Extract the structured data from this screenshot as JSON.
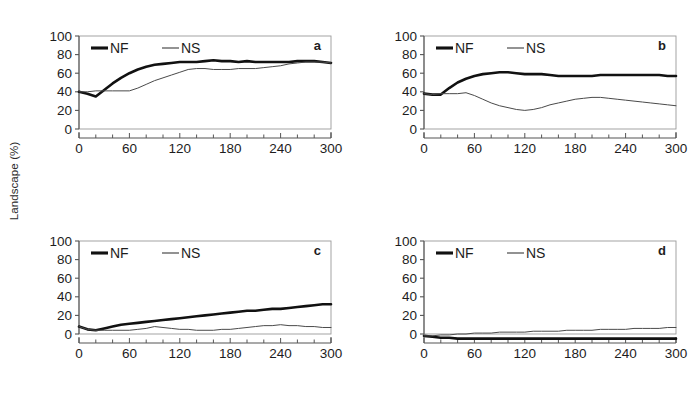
{
  "figure": {
    "ylabel": "Landscape (%)",
    "series_colors": {
      "NF": "#111111",
      "NS": "#4a4a4a"
    },
    "axis_color": "#555555"
  },
  "chart_data": [
    {
      "type": "line",
      "panel": "a",
      "title": "",
      "xlabel": "",
      "ylabel": "Landscape (%)",
      "xlim": [
        0,
        300
      ],
      "ylim": [
        0,
        100
      ],
      "xticks": [
        0,
        60,
        120,
        180,
        240,
        300
      ],
      "xtick_labels": [
        "0",
        "60",
        "120",
        "180",
        "240",
        "300"
      ],
      "yticks": [
        0,
        20,
        40,
        60,
        80,
        100
      ],
      "ytick_labels": [
        "0",
        "20",
        "40",
        "60",
        "80",
        "100"
      ],
      "minor_xtick_step": 20,
      "grid": false,
      "legend": [
        "NF",
        "NS"
      ],
      "legend_position": "top-left",
      "x": [
        0,
        10,
        20,
        30,
        40,
        50,
        60,
        70,
        80,
        90,
        100,
        110,
        120,
        130,
        140,
        150,
        160,
        170,
        180,
        190,
        200,
        210,
        220,
        230,
        240,
        250,
        260,
        270,
        280,
        290,
        300
      ],
      "series": [
        {
          "name": "NF",
          "values": [
            40,
            38,
            35,
            42,
            49,
            55,
            60,
            64,
            67,
            69,
            70,
            71,
            72,
            72,
            72,
            73,
            74,
            73,
            73,
            72,
            73,
            72,
            72,
            72,
            72,
            72,
            73,
            73,
            73,
            72,
            71
          ]
        },
        {
          "name": "NS",
          "values": [
            40,
            40,
            41,
            41,
            41,
            41,
            41,
            44,
            48,
            52,
            55,
            58,
            61,
            64,
            65,
            65,
            64,
            64,
            64,
            65,
            65,
            65,
            66,
            67,
            68,
            70,
            71,
            72,
            72,
            72,
            71
          ]
        }
      ]
    },
    {
      "type": "line",
      "panel": "b",
      "title": "",
      "xlabel": "",
      "ylabel": "Landscape (%)",
      "xlim": [
        0,
        300
      ],
      "ylim": [
        0,
        100
      ],
      "xticks": [
        0,
        60,
        120,
        180,
        240,
        300
      ],
      "xtick_labels": [
        "0",
        "60",
        "120",
        "180",
        "240",
        "300"
      ],
      "yticks": [
        0,
        20,
        40,
        60,
        80,
        100
      ],
      "ytick_labels": [
        "0",
        "20",
        "40",
        "60",
        "80",
        "100"
      ],
      "minor_xtick_step": 20,
      "grid": false,
      "legend": [
        "NF",
        "NS"
      ],
      "legend_position": "top-left",
      "x": [
        0,
        10,
        20,
        30,
        40,
        50,
        60,
        70,
        80,
        90,
        100,
        110,
        120,
        130,
        140,
        150,
        160,
        170,
        180,
        190,
        200,
        210,
        220,
        230,
        240,
        250,
        260,
        270,
        280,
        290,
        300
      ],
      "series": [
        {
          "name": "NF",
          "values": [
            38,
            37,
            37,
            44,
            50,
            54,
            57,
            59,
            60,
            61,
            61,
            60,
            59,
            59,
            59,
            58,
            57,
            57,
            57,
            57,
            57,
            58,
            58,
            58,
            58,
            58,
            58,
            58,
            58,
            57,
            57
          ]
        },
        {
          "name": "NS",
          "values": [
            38,
            37,
            38,
            38,
            38,
            39,
            36,
            32,
            28,
            25,
            23,
            21,
            20,
            21,
            23,
            26,
            28,
            30,
            32,
            33,
            34,
            34,
            33,
            32,
            31,
            30,
            29,
            28,
            27,
            26,
            25
          ]
        }
      ]
    },
    {
      "type": "line",
      "panel": "c",
      "title": "",
      "xlabel": "",
      "ylabel": "Landscape (%)",
      "xlim": [
        0,
        300
      ],
      "ylim": [
        0,
        100
      ],
      "xticks": [
        0,
        60,
        120,
        180,
        240,
        300
      ],
      "xtick_labels": [
        "0",
        "60",
        "120",
        "180",
        "240",
        "300"
      ],
      "yticks": [
        0,
        20,
        40,
        60,
        80,
        100
      ],
      "ytick_labels": [
        "0",
        "20",
        "40",
        "60",
        "80",
        "100"
      ],
      "minor_xtick_step": 20,
      "grid": false,
      "legend": [
        "NF",
        "NS"
      ],
      "legend_position": "top-left",
      "x": [
        0,
        10,
        20,
        30,
        40,
        50,
        60,
        70,
        80,
        90,
        100,
        110,
        120,
        130,
        140,
        150,
        160,
        170,
        180,
        190,
        200,
        210,
        220,
        230,
        240,
        250,
        260,
        270,
        280,
        290,
        300
      ],
      "series": [
        {
          "name": "NF",
          "values": [
            8,
            5,
            4,
            6,
            8,
            10,
            11,
            12,
            13,
            14,
            15,
            16,
            17,
            18,
            19,
            20,
            21,
            22,
            23,
            24,
            25,
            25,
            26,
            27,
            27,
            28,
            29,
            30,
            31,
            32,
            32
          ]
        },
        {
          "name": "NS",
          "values": [
            8,
            5,
            4,
            4,
            4,
            4,
            4,
            5,
            6,
            8,
            7,
            6,
            5,
            5,
            4,
            4,
            4,
            5,
            5,
            6,
            7,
            8,
            9,
            9,
            10,
            9,
            9,
            8,
            8,
            7,
            7
          ]
        }
      ]
    },
    {
      "type": "line",
      "panel": "d",
      "title": "",
      "xlabel": "",
      "ylabel": "Landscape (%)",
      "xlim": [
        0,
        300
      ],
      "ylim": [
        0,
        100
      ],
      "xticks": [
        0,
        60,
        120,
        180,
        240,
        300
      ],
      "xtick_labels": [
        "0",
        "60",
        "120",
        "180",
        "240",
        "300"
      ],
      "yticks": [
        0,
        20,
        40,
        60,
        80,
        100
      ],
      "ytick_labels": [
        "0",
        "20",
        "40",
        "60",
        "80",
        "100"
      ],
      "minor_xtick_step": 20,
      "grid": false,
      "legend": [
        "NF",
        "NS"
      ],
      "legend_position": "top-left",
      "x": [
        0,
        10,
        20,
        30,
        40,
        50,
        60,
        70,
        80,
        90,
        100,
        110,
        120,
        130,
        140,
        150,
        160,
        170,
        180,
        190,
        200,
        210,
        220,
        230,
        240,
        250,
        260,
        270,
        280,
        290,
        300
      ],
      "series": [
        {
          "name": "NF",
          "values": [
            -2,
            -3,
            -4,
            -4,
            -5,
            -5,
            -5,
            -5,
            -5,
            -5,
            -5,
            -5,
            -5,
            -5,
            -5,
            -5,
            -5,
            -5,
            -5,
            -5,
            -5,
            -5,
            -5,
            -5,
            -5,
            -5,
            -5,
            -5,
            -5,
            -5,
            -5
          ]
        },
        {
          "name": "NS",
          "values": [
            -2,
            -2,
            -1,
            -1,
            0,
            0,
            1,
            1,
            1,
            2,
            2,
            2,
            2,
            3,
            3,
            3,
            3,
            4,
            4,
            4,
            4,
            5,
            5,
            5,
            5,
            6,
            6,
            6,
            6,
            7,
            7
          ]
        }
      ]
    }
  ]
}
